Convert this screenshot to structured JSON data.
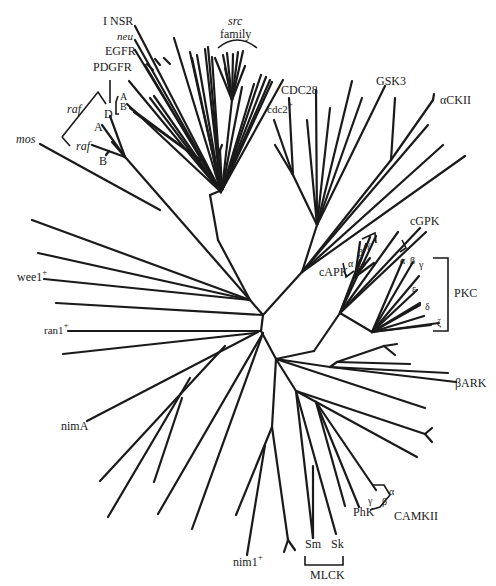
{
  "figure": {
    "type": "unrooted phylogenetic tree",
    "stroke_color": "#1a1a1a",
    "background": "#ffffff"
  },
  "labels": {
    "insr": "I NSR",
    "neu": "neu",
    "egfr": "EGFR",
    "pdgfr": "PDGFR",
    "pdgfr_a": "A",
    "pdgfr_b": "B",
    "pdgfr_d": "D",
    "raf_top": "raf",
    "raf_a": "A",
    "raf_bottom": "raf",
    "raf_b": "B",
    "mos": "mos",
    "src": "src",
    "family": "family",
    "cdc28": "CDC28",
    "cdc2": "cdc2",
    "cdc2_sup": "+",
    "gsk3": "GSK3",
    "ackii": "αCKII",
    "cgpk": "cGPK",
    "capk": "cAPK",
    "capk_alpha": "α",
    "capk_beta": "β",
    "capk_gamma": "γ",
    "pkc_alpha": "α",
    "pkc_beta": "β",
    "pkc_gamma": "γ",
    "pkc_epsilon": "ε",
    "pkc_delta": "δ",
    "pkc_zeta": "ζ",
    "pkc": "PKC",
    "bark": "βARK",
    "wee1": "wee1",
    "wee1_sup": "+",
    "ran1": "ran1",
    "ran1_sup": "+",
    "nima": "nimA",
    "nim1": "nim1",
    "nim1_sup": "+",
    "sm": "Sm",
    "sk": "Sk",
    "mlck": "MLCK",
    "phk": "PhK",
    "camkii_gamma": "γ",
    "camkii_beta": "β",
    "camkii_alpha": "α",
    "camkii": "CAMKII"
  }
}
